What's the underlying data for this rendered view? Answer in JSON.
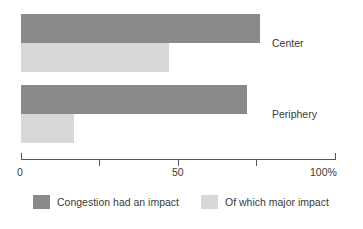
{
  "chart_data": {
    "type": "bar",
    "orientation": "horizontal",
    "title": "",
    "xlabel": "",
    "ylabel": "",
    "categories": [
      "Center",
      "Periphery"
    ],
    "series": [
      {
        "name": "Congestion had an impact",
        "color": "#8a8a8a",
        "values": [
          76,
          72
        ]
      },
      {
        "name": "Of which major impact",
        "color": "#d8d8d8",
        "values": [
          47,
          17
        ]
      }
    ],
    "xlim": [
      0,
      100
    ],
    "xticks": [
      0,
      25,
      50,
      75,
      100
    ],
    "xtick_labels": [
      "0",
      "",
      "50",
      "",
      "100%"
    ],
    "grid": false,
    "legend_position": "bottom"
  },
  "axis": {
    "tick_label_0": "0",
    "tick_label_50": "50",
    "tick_label_100": "100%"
  },
  "categories": {
    "center": "Center",
    "periphery": "Periphery"
  },
  "legend": {
    "item1_label": "Congestion had an impact",
    "item2_label": "Of which major impact"
  },
  "colors": {
    "dark": "#8a8a8a",
    "light": "#d8d8d8",
    "axis": "#555555",
    "text": "#3a3a3a"
  }
}
